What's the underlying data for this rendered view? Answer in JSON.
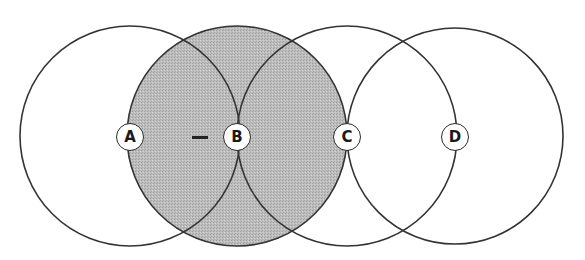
{
  "diagram": {
    "colors": {
      "stroke": "#333333",
      "shade": "#b9b9b9",
      "background": "#ffffff",
      "label_fill": "#ffffff"
    },
    "circles": [
      {
        "id": "A",
        "cx": 130,
        "cy": 136,
        "r": 110,
        "shaded": false
      },
      {
        "id": "B",
        "cx": 237,
        "cy": 136,
        "r": 110,
        "shaded": true
      },
      {
        "id": "C",
        "cx": 347,
        "cy": 136,
        "r": 110,
        "shaded": false
      },
      {
        "id": "D",
        "cx": 455,
        "cy": 136,
        "r": 108,
        "shaded": false
      }
    ],
    "nodes": [
      {
        "label": "A",
        "x": 130,
        "y": 137
      },
      {
        "label": "B",
        "x": 237,
        "y": 137
      },
      {
        "label": "C",
        "x": 347,
        "y": 137
      },
      {
        "label": "D",
        "x": 455,
        "y": 137
      }
    ],
    "dash": {
      "x1": 192,
      "x2": 208,
      "y": 137
    }
  }
}
